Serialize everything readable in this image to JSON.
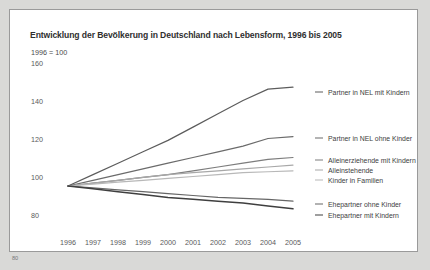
{
  "figure": {
    "page_number": "80",
    "panel_background": "#ffffff",
    "page_background": "#d9d9d7",
    "border_color": "#9a9a9a"
  },
  "chart_data": {
    "type": "line",
    "title": "Entwicklung der Bevölkerung in Deutschland nach Lebensform, 1996 bis 2005",
    "subtitle": "1996 = 100",
    "xlabel": "",
    "ylabel": "",
    "grid": false,
    "legend_position": "right-inline-end-of-line",
    "x": [
      1996,
      1997,
      1998,
      1999,
      2000,
      2001,
      2002,
      2003,
      2004,
      2005
    ],
    "categories": [
      "1996",
      "1997",
      "1998",
      "1999",
      "2000",
      "2001",
      "2002",
      "2003",
      "2004",
      "2005"
    ],
    "xlim": [
      1996,
      2005
    ],
    "ylim": [
      80,
      165
    ],
    "yticks": [
      160,
      140,
      120,
      100,
      80
    ],
    "ytick_labels": [
      "160",
      "140",
      "120",
      "100",
      "80"
    ],
    "series": [
      {
        "name": "Partner in NEL mit Kindern",
        "color": "#5c5c5c",
        "values": [
          100,
          106,
          112,
          118,
          124,
          131,
          138,
          145,
          151,
          152
        ]
      },
      {
        "name": "Partner in NEL ohne Kinder",
        "color": "#6b6b6b",
        "values": [
          100,
          103,
          106,
          109,
          112,
          115,
          118,
          121,
          125,
          126
        ]
      },
      {
        "name": "Alleinerziehende mit Kindern",
        "color": "#7d7d7d",
        "values": [
          100,
          101.5,
          103,
          104.5,
          106,
          108,
          110,
          112,
          114,
          115
        ]
      },
      {
        "name": "Alleinstehende",
        "color": "#a8a8a8",
        "values": [
          100,
          101.5,
          103,
          104.5,
          106,
          107,
          108,
          109,
          110,
          111
        ]
      },
      {
        "name": "Kinder in Familien",
        "color": "#b8b8b8",
        "values": [
          100,
          101,
          102,
          103,
          104,
          105,
          106,
          107,
          107.5,
          108
        ]
      },
      {
        "name": "Ehepartner ohne Kinder",
        "color": "#666666",
        "values": [
          100,
          99,
          98,
          97,
          96,
          95,
          94,
          93.5,
          93,
          92
        ]
      },
      {
        "name": "Ehepartner mit Kindern",
        "color": "#3f3f3f",
        "values": [
          100,
          98.5,
          97,
          95.5,
          94,
          93,
          92,
          91,
          89.5,
          88
        ]
      }
    ]
  },
  "series_labels": [
    {
      "text": "Partner in NEL mit Kindern",
      "top": 82
    },
    {
      "text": "Partner in NEL ohne Kinder",
      "top": 128
    },
    {
      "text": "Alleinerziehende mit Kindern",
      "top": 150
    },
    {
      "text": "Alleinstehende",
      "top": 160
    },
    {
      "text": "Kinder in Familien",
      "top": 170
    },
    {
      "text": "Ehepartner ohne Kinder",
      "top": 194
    },
    {
      "text": "Ehepartner mit Kindern",
      "top": 205
    }
  ]
}
